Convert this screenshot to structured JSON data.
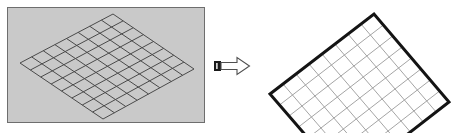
{
  "figure": {
    "title": "",
    "caption": "",
    "background_color": "#ffffff"
  },
  "left_panel": {
    "name": "source-mesh-photo-panel",
    "fill_color": "#c9c9c9",
    "border_color": "#6e6e6e",
    "description": "Grey photographic panel showing a perspective-distorted rhombic mesh grid",
    "grid": {
      "rows": 8,
      "cols": 8,
      "line_color": "#4a4a4a",
      "line_width": 1,
      "shape": "rhombus",
      "corners": {
        "left": [
          12,
          55
        ],
        "top": [
          105,
          6
        ],
        "right": [
          186,
          61
        ],
        "bottom": [
          95,
          111
        ]
      }
    }
  },
  "arrow": {
    "name": "transform-arrow",
    "direction": "right",
    "label": "",
    "outline_color": "#4f4f4f",
    "fill_color": "#ffffff",
    "tail_color": "#1a1a1a"
  },
  "right_panel": {
    "name": "rectified-mesh-panel",
    "fill_color": "#ffffff",
    "description": "White panel showing the rectified regular quadrilateral mesh grid",
    "grid": {
      "rows": 8,
      "cols": 8,
      "line_color": "#9a9a9a",
      "line_width": 1,
      "border_color": "#141414",
      "border_width": 3,
      "shape": "parallelogram",
      "corners": {
        "left": [
          8,
          92
        ],
        "top": [
          112,
          12
        ],
        "right": [
          187,
          100
        ],
        "bottom": [
          84,
          180
        ]
      }
    }
  },
  "chart_data": {
    "type": "diagram",
    "panels": [
      {
        "id": "before",
        "label": "",
        "grid_rows": 8,
        "grid_cols": 8,
        "grid_type": "perspective-rhombus"
      },
      {
        "id": "after",
        "label": "",
        "grid_rows": 8,
        "grid_cols": 8,
        "grid_type": "regular-parallelogram"
      }
    ],
    "connector": "arrow-right"
  }
}
